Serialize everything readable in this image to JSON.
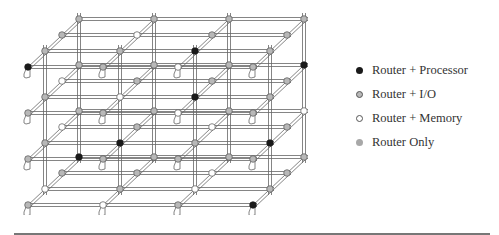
{
  "colors": {
    "processor": "#1a1a1a",
    "io": "#b8b8b8",
    "memory": "#ffffff",
    "router_only": "#a8a8a8",
    "stroke": "#555555",
    "line": "#666666"
  },
  "legend": {
    "items": [
      {
        "type": "processor",
        "label": "Router + Processor"
      },
      {
        "type": "io",
        "label": "Router + I/O"
      },
      {
        "type": "memory",
        "label": "Router + Memory"
      },
      {
        "type": "router_only",
        "label": "Router Only"
      }
    ]
  },
  "mesh": {
    "columns": 4,
    "layers": 4,
    "depth": 4,
    "nodes": [
      [
        "io",
        "memory",
        "io",
        "processor",
        "memory",
        "io",
        "io",
        "io",
        "io",
        "memory",
        "memory",
        "io",
        "processor",
        "io",
        "io",
        "io"
      ],
      [
        "io",
        "io",
        "memory",
        "io",
        "io",
        "processor",
        "io",
        "io",
        "io",
        "io",
        "memory",
        "io",
        "io",
        "processor",
        "io",
        "memory"
      ],
      [
        "io",
        "io",
        "memory",
        "io",
        "io",
        "memory",
        "io",
        "io",
        "memory",
        "processor",
        "io",
        "io",
        "io",
        "io",
        "io",
        "processor"
      ],
      [
        "processor",
        "io",
        "io",
        "io",
        "io",
        "io",
        "memory",
        "io",
        "memory",
        "processor",
        "io",
        "io",
        "io",
        "io",
        "io",
        "io"
      ]
    ]
  }
}
